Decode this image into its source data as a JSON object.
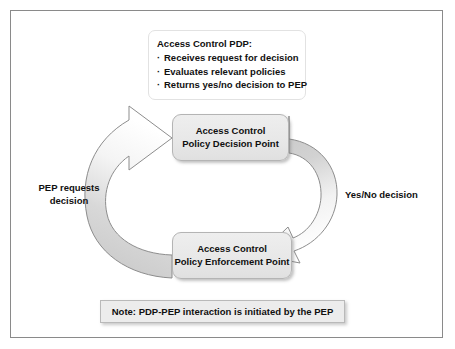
{
  "frame": {
    "border_color": "#8a8a8a"
  },
  "callout": {
    "title": "Access Control PDP:",
    "items": [
      "Receives request for decision",
      "Evaluates relevant policies",
      "Returns yes/no decision to PEP"
    ]
  },
  "nodes": {
    "pdp": {
      "line1": "Access Control",
      "line2": "Policy Decision Point"
    },
    "pep": {
      "line1": "Access Control",
      "line2": "Policy Enforcement Point"
    }
  },
  "labels": {
    "left_line1": "PEP requests",
    "left_line2": "decision",
    "right": "Yes/No decision"
  },
  "note": {
    "text": "Note: PDP-PEP interaction is initiated by the PEP"
  },
  "arrows": {
    "left_arrow_name": "request-arrow-pep-to-pdp",
    "right_arrow_name": "response-arrow-pdp-to-pep",
    "fill_gray": "#c8c8c8",
    "fill_white": "#ffffff",
    "stroke": "#8d8d8d"
  },
  "colors": {
    "node_fill": "#e8e8e8",
    "node_border": "#b4b4b4",
    "note_fill": "#ececec",
    "text": "#101010"
  }
}
